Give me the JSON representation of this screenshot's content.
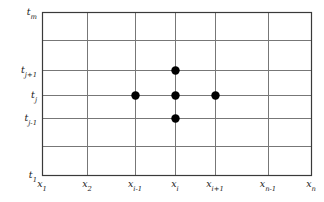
{
  "figure": {
    "type": "finite-difference-grid-stencil",
    "background_color": "#ffffff",
    "frame_color": "#3a3a3a",
    "gridline_color": "#777777",
    "dot_color": "#000000",
    "plot_area": {
      "left": 42,
      "top": 12,
      "right": 311,
      "bottom": 175
    }
  },
  "y_axis": {
    "name": "time-axis",
    "ticks": [
      {
        "id": "tm",
        "base": "t",
        "sub": "m",
        "y": 12,
        "label": "t_m"
      },
      {
        "id": "tjp1",
        "base": "t",
        "sub": "j+1",
        "y": 70,
        "label": "t_j+1"
      },
      {
        "id": "tj",
        "base": "t",
        "sub": "j",
        "y": 95,
        "label": "t_j"
      },
      {
        "id": "tjm1",
        "base": "t",
        "sub": "j-1",
        "y": 118,
        "label": "t_j-1"
      },
      {
        "id": "t1",
        "base": "t",
        "sub": "1",
        "y": 175,
        "label": "t_1"
      }
    ]
  },
  "x_axis": {
    "name": "space-axis",
    "ticks": [
      {
        "id": "x1",
        "base": "x",
        "sub": "1",
        "x": 42,
        "label": "x_1"
      },
      {
        "id": "x2",
        "base": "x",
        "sub": "2",
        "x": 87,
        "label": "x_2"
      },
      {
        "id": "xim1",
        "base": "x",
        "sub": "i-1",
        "x": 135,
        "label": "x_i-1"
      },
      {
        "id": "xi",
        "base": "x",
        "sub": "i",
        "x": 175,
        "label": "x_i"
      },
      {
        "id": "xip1",
        "base": "x",
        "sub": "i+1",
        "x": 215,
        "label": "x_i+1"
      },
      {
        "id": "xnm1",
        "base": "x",
        "sub": "n-1",
        "x": 268,
        "label": "x_n-1"
      },
      {
        "id": "xn",
        "base": "x",
        "sub": "n",
        "x": 311,
        "label": "x_n"
      }
    ]
  },
  "gridlines": {
    "vertical_x": [
      42,
      87,
      135,
      175,
      215,
      268,
      311
    ],
    "horizontal_y": [
      12,
      40,
      70,
      95,
      118,
      146,
      175
    ]
  },
  "stencil": {
    "name": "five-point-stencil",
    "radius": 4.2,
    "points": [
      {
        "name": "node-center",
        "x": 175,
        "y": 95,
        "x_label": "x_i",
        "t_label": "t_j"
      },
      {
        "name": "node-upper",
        "x": 175,
        "y": 70,
        "x_label": "x_i",
        "t_label": "t_j+1"
      },
      {
        "name": "node-lower",
        "x": 175,
        "y": 118,
        "x_label": "x_i",
        "t_label": "t_j-1"
      },
      {
        "name": "node-left",
        "x": 135,
        "y": 95,
        "x_label": "x_i-1",
        "t_label": "t_j"
      },
      {
        "name": "node-right",
        "x": 215,
        "y": 95,
        "x_label": "x_i+1",
        "t_label": "t_j"
      }
    ]
  }
}
